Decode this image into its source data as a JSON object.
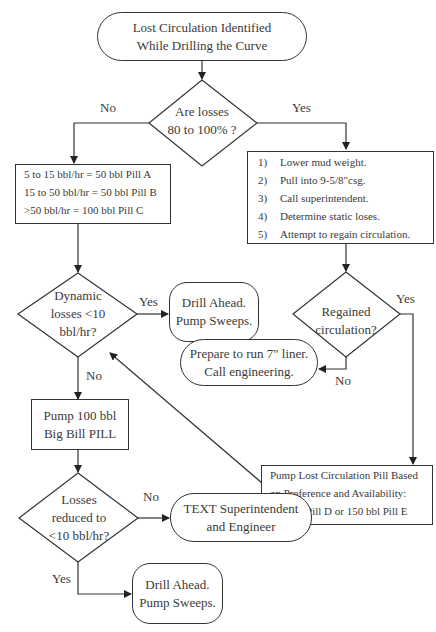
{
  "nodes": {
    "start": {
      "line1": "Lost Circulation Identified",
      "line2": "While Drilling the Curve"
    },
    "decision_losses": {
      "line1": "Are losses",
      "line2": "80 to 100% ?"
    },
    "pill_table": {
      "line1": "5 to 15 bbl/hr = 50 bbl Pill A",
      "line2": "15 to 50 bbl/hr = 50 bbl Pill B",
      "line3": ">50 bbl/hr = 100 bbl Pill C"
    },
    "steps": {
      "items": [
        {
          "num": "1)",
          "text": "Lower mud weight."
        },
        {
          "num": "2)",
          "text": "Pull into 9-5/8\"csg."
        },
        {
          "num": "3)",
          "text": "Call superintendent."
        },
        {
          "num": "4)",
          "text": "Determine static loses."
        },
        {
          "num": "5)",
          "text": "Attempt to regain circulation."
        }
      ]
    },
    "decision_dynamic": {
      "line1": "Dynamic",
      "line2": "losses <10",
      "line3": "bbl/hr?"
    },
    "drill_ahead_1": {
      "line1": "Drill Ahead.",
      "line2": "Pump Sweeps."
    },
    "decision_regained": {
      "line1": "Regained",
      "line2": "circulation?"
    },
    "prepare_liner": {
      "line1": "Prepare to run 7\" liner.",
      "line2": "Call engineering."
    },
    "pump_big_pill": {
      "line1": "Pump 100 bbl",
      "line2": "Big Bill PILL"
    },
    "pump_lc_pill": {
      "line1": "Pump Lost Circulation Pill Based",
      "line2": "on Preference and Availability:",
      "line3": "150 bbl Pill D or 150 bbl Pill E"
    },
    "decision_reduced": {
      "line1": "Losses",
      "line2": "reduced to",
      "line3": "<10 bbl/hr?"
    },
    "text_super": {
      "line1": "TEXT Superintendent",
      "line2": "and Engineer"
    },
    "drill_ahead_2": {
      "line1": "Drill Ahead.",
      "line2": "Pump Sweeps."
    }
  },
  "edge_labels": {
    "losses_no": "No",
    "losses_yes": "Yes",
    "dynamic_yes": "Yes",
    "dynamic_no": "No",
    "regained_yes": "Yes",
    "regained_no": "No",
    "reduced_no": "No",
    "reduced_yes": "Yes"
  }
}
